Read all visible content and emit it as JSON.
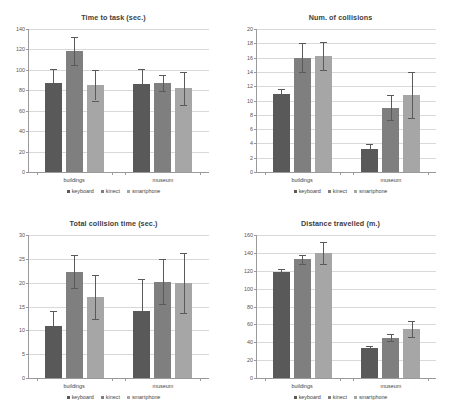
{
  "figure": {
    "background": "#ffffff",
    "series_colors": {
      "keyboard": "#595959",
      "kinect": "#7f7f7f",
      "smartphone": "#a6a6a6"
    },
    "legend": {
      "position": "bottom-center",
      "marker": "square",
      "items": [
        {
          "label": "keyboard",
          "color": "#595959"
        },
        {
          "label": "kinect",
          "color": "#7f7f7f"
        },
        {
          "label": "smartphone",
          "color": "#a6a6a6"
        }
      ]
    },
    "categories": [
      "buildings",
      "museum"
    ]
  },
  "chart_data": [
    {
      "id": "time-to-task",
      "type": "bar",
      "title": "Time to task (sec.)",
      "xlabel": "",
      "ylabel": "",
      "ylim": [
        0,
        140
      ],
      "yticks": [
        0,
        20,
        40,
        60,
        80,
        100,
        120,
        140
      ],
      "grid": true,
      "categories": [
        "buildings",
        "museum"
      ],
      "series": [
        {
          "name": "keyboard",
          "color": "#595959",
          "values": [
            87.0,
            86.0
          ],
          "errors": [
            14.0,
            14.5
          ]
        },
        {
          "name": "kinect",
          "color": "#7f7f7f",
          "values": [
            118.5,
            87.0
          ],
          "errors": [
            14.0,
            7.5
          ]
        },
        {
          "name": "smartphone",
          "color": "#a6a6a6",
          "values": [
            85.0,
            82.0
          ],
          "errors": [
            15.0,
            16.0
          ]
        }
      ]
    },
    {
      "id": "num-of-collisions",
      "type": "bar",
      "title": "Num. of collisions",
      "xlabel": "",
      "ylabel": "",
      "ylim": [
        0,
        20
      ],
      "yticks": [
        0,
        2,
        4,
        6,
        8,
        10,
        12,
        14,
        16,
        18,
        20
      ],
      "grid": true,
      "categories": [
        "buildings",
        "museum"
      ],
      "series": [
        {
          "name": "keyboard",
          "color": "#595959",
          "values": [
            10.9,
            3.2
          ],
          "errors": [
            0.7,
            0.7
          ]
        },
        {
          "name": "kinect",
          "color": "#7f7f7f",
          "values": [
            16.0,
            9.0
          ],
          "errors": [
            2.0,
            1.7
          ]
        },
        {
          "name": "smartphone",
          "color": "#a6a6a6",
          "values": [
            16.2,
            10.8
          ],
          "errors": [
            2.0,
            3.2
          ]
        }
      ]
    },
    {
      "id": "total-collision-time",
      "type": "bar",
      "title": "Total collision time (sec.)",
      "xlabel": "",
      "ylabel": "",
      "ylim": [
        0,
        30
      ],
      "yticks": [
        0,
        5,
        10,
        15,
        20,
        25,
        30
      ],
      "grid": true,
      "categories": [
        "buildings",
        "museum"
      ],
      "series": [
        {
          "name": "keyboard",
          "color": "#595959",
          "values": [
            11.0,
            14.0
          ],
          "errors": [
            3.0,
            6.8
          ]
        },
        {
          "name": "kinect",
          "color": "#7f7f7f",
          "values": [
            22.3,
            20.2
          ],
          "errors": [
            3.5,
            4.7
          ]
        },
        {
          "name": "smartphone",
          "color": "#a6a6a6",
          "values": [
            17.0,
            20.0
          ],
          "errors": [
            4.7,
            6.3
          ]
        }
      ]
    },
    {
      "id": "distance-travelled",
      "type": "bar",
      "title": "Distance travelled (m.)",
      "xlabel": "",
      "ylabel": "",
      "ylim": [
        0,
        160
      ],
      "yticks": [
        0,
        20,
        40,
        60,
        80,
        100,
        120,
        140,
        160
      ],
      "grid": true,
      "categories": [
        "buildings",
        "museum"
      ],
      "series": [
        {
          "name": "keyboard",
          "color": "#595959",
          "values": [
            119.0,
            34.0
          ],
          "errors": [
            3.0,
            2.0
          ]
        },
        {
          "name": "kinect",
          "color": "#7f7f7f",
          "values": [
            133.0,
            45.0
          ],
          "errors": [
            5.0,
            4.0
          ]
        },
        {
          "name": "smartphone",
          "color": "#a6a6a6",
          "values": [
            140.0,
            55.0
          ],
          "errors": [
            12.0,
            9.0
          ]
        }
      ]
    }
  ]
}
